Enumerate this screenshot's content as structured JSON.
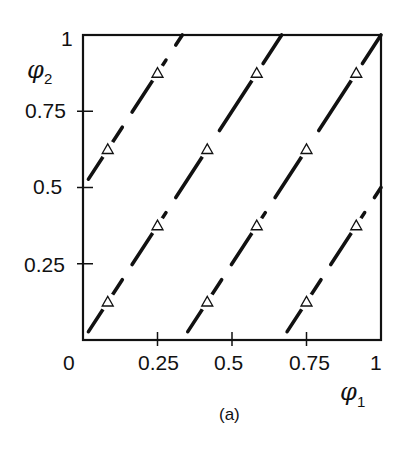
{
  "chart_data": {
    "type": "line",
    "title": "",
    "caption": "(a)",
    "xlabel": "φ1",
    "ylabel": "φ2",
    "xlabel_symbol": "φ",
    "xlabel_subscript": "1",
    "ylabel_symbol": "φ",
    "ylabel_subscript": "2",
    "xlim": [
      0,
      1
    ],
    "ylim": [
      0,
      1
    ],
    "grid": false,
    "legend": null,
    "x_ticks": [
      0,
      0.25,
      0.5,
      0.75,
      1
    ],
    "x_tick_labels": [
      "0",
      "0.25",
      "0.5",
      "0.75",
      "1"
    ],
    "y_ticks": [
      0.25,
      0.5,
      0.75,
      1
    ],
    "y_tick_labels": [
      "0.25",
      "0.5",
      "0.75",
      "1"
    ],
    "series": [
      {
        "name": "line-1",
        "style": "dashed",
        "x": [
          0,
          0.6667
        ],
        "y": [
          0,
          1
        ]
      },
      {
        "name": "line-2",
        "style": "dashed",
        "x": [
          0,
          0.3333
        ],
        "y": [
          0.5,
          1
        ]
      },
      {
        "name": "line-3",
        "style": "dashed",
        "x": [
          0.3333,
          1
        ],
        "y": [
          0,
          1
        ]
      },
      {
        "name": "line-4",
        "style": "dashed",
        "x": [
          0.6667,
          1
        ],
        "y": [
          0,
          0.5
        ]
      }
    ],
    "markers": {
      "shape": "open-triangle",
      "points": [
        [
          0.083,
          0.125
        ],
        [
          0.25,
          0.375
        ],
        [
          0.083,
          0.625
        ],
        [
          0.25,
          0.875
        ],
        [
          0.417,
          0.125
        ],
        [
          0.583,
          0.375
        ],
        [
          0.417,
          0.625
        ],
        [
          0.583,
          0.875
        ],
        [
          0.75,
          0.125
        ],
        [
          0.917,
          0.375
        ],
        [
          0.75,
          0.625
        ],
        [
          0.917,
          0.875
        ]
      ]
    }
  },
  "colors": {
    "ink": "#111111",
    "background": "#ffffff"
  }
}
